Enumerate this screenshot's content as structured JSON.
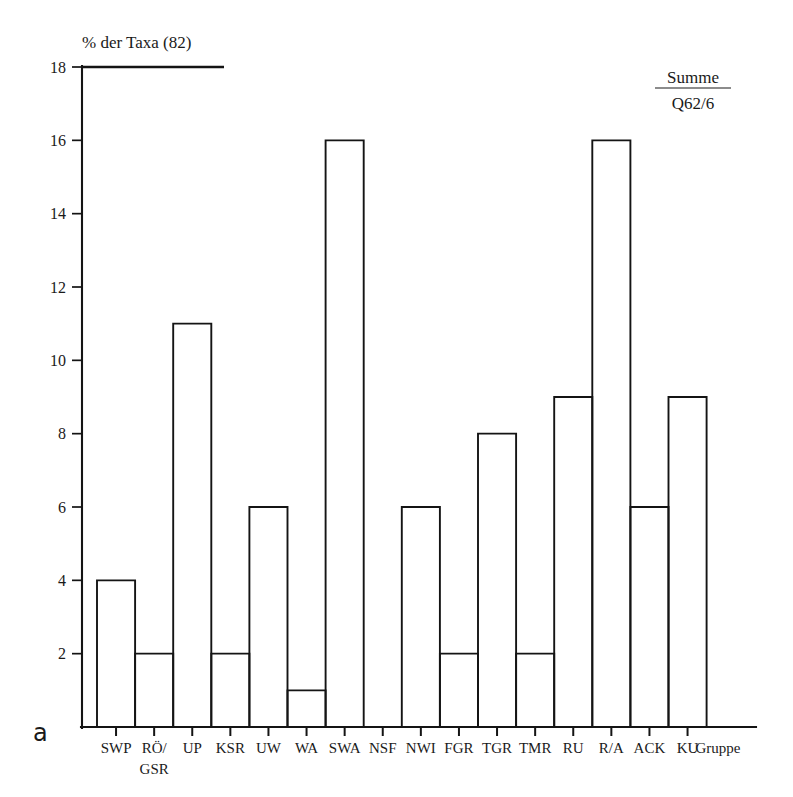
{
  "panel": {
    "letter": "a"
  },
  "legend": {
    "line1": "Summe",
    "line2": "Q62/6"
  },
  "chart_data": {
    "type": "bar",
    "title": "% der Taxa (82)",
    "subtitle": "",
    "xlabel": "Gruppe",
    "ylabel": "% der Taxa (82)",
    "categories": [
      "SWP",
      "RÖ/ GSR",
      "UP",
      "KSR",
      "UW",
      "WA",
      "SWA",
      "NSF",
      "NWI",
      "FGR",
      "TGR",
      "TMR",
      "RU",
      "R/A",
      "ACK",
      "KU"
    ],
    "category_lines": [
      [
        "SWP"
      ],
      [
        "RÖ/",
        "GSR"
      ],
      [
        "UP"
      ],
      [
        "KSR"
      ],
      [
        "UW"
      ],
      [
        "WA"
      ],
      [
        "SWA"
      ],
      [
        "NSF"
      ],
      [
        "NWI"
      ],
      [
        "FGR"
      ],
      [
        "TGR"
      ],
      [
        "TMR"
      ],
      [
        "RU"
      ],
      [
        "R/A"
      ],
      [
        "ACK"
      ],
      [
        "KU"
      ]
    ],
    "values": [
      4,
      2,
      11,
      2,
      6,
      1,
      16,
      0,
      6,
      2,
      8,
      2,
      9,
      16,
      6,
      9
    ],
    "ylim": [
      0,
      18
    ],
    "yticks": [
      2,
      4,
      6,
      8,
      10,
      12,
      14,
      16,
      18
    ],
    "ytick_labels": [
      "2",
      "4",
      "6",
      "8",
      "10",
      "12",
      "14",
      "16",
      "18"
    ],
    "grid": false,
    "legend_position": "top-right",
    "bar_style": "outline",
    "bar_fill": "#ffffff",
    "bar_stroke": "#141414",
    "annotations": [
      "Summe",
      "Q62/6",
      "a"
    ]
  }
}
